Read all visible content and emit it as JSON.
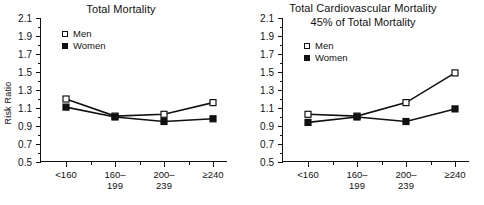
{
  "figure": {
    "panels": [
      "left",
      "right"
    ]
  },
  "chart_data": [
    {
      "type": "line",
      "panel": "left",
      "title": "Total Mortality",
      "subtitle": "",
      "xlabel": "",
      "ylabel": "Risk Ratio",
      "categories": [
        "<160",
        "160–199",
        "200–239",
        "≥240"
      ],
      "category_lines": [
        [
          "<160"
        ],
        [
          "160–",
          "199"
        ],
        [
          "200–",
          "239"
        ],
        [
          "≥240"
        ]
      ],
      "ylim": [
        0.5,
        2.1
      ],
      "ytick_labels": [
        "0.5",
        "0.7",
        "0.9",
        "1.1",
        "1.3",
        "1.5",
        "1.7",
        "1.9",
        "2.1"
      ],
      "ytick_values": [
        0.5,
        0.7,
        0.9,
        1.1,
        1.3,
        1.5,
        1.7,
        1.9,
        2.1
      ],
      "grid": false,
      "legend_position": "upper-left",
      "series": [
        {
          "name": "Men",
          "marker": "open-square",
          "values": [
            1.2,
            1.01,
            1.03,
            1.16
          ]
        },
        {
          "name": "Women",
          "marker": "filled-square",
          "values": [
            1.11,
            1.0,
            0.95,
            0.98
          ]
        }
      ]
    },
    {
      "type": "line",
      "panel": "right",
      "title": "Total Cardiovascular Mortality",
      "subtitle": "45% of Total Mortality",
      "xlabel": "",
      "ylabel": "",
      "categories": [
        "<160",
        "160–199",
        "200–239",
        "≥240"
      ],
      "category_lines": [
        [
          "<160"
        ],
        [
          "160–",
          "199"
        ],
        [
          "200–",
          "239"
        ],
        [
          "≥240"
        ]
      ],
      "ylim": [
        0.5,
        2.1
      ],
      "ytick_labels": [
        "0.5",
        "0.7",
        "0.9",
        "1.1",
        "1.3",
        "1.5",
        "1.7",
        "1.9",
        "2.1"
      ],
      "ytick_values": [
        0.5,
        0.7,
        0.9,
        1.1,
        1.3,
        1.5,
        1.7,
        1.9,
        2.1
      ],
      "grid": false,
      "legend_position": "upper-left",
      "series": [
        {
          "name": "Men",
          "marker": "open-square",
          "values": [
            1.03,
            1.01,
            1.16,
            1.49
          ]
        },
        {
          "name": "Women",
          "marker": "filled-square",
          "values": [
            0.94,
            1.0,
            0.95,
            1.09
          ]
        }
      ]
    }
  ],
  "colors": {
    "ink": "#111111",
    "background": "#ffffff",
    "men_marker_fill": "#ffffff",
    "women_marker_fill": "#111111"
  }
}
